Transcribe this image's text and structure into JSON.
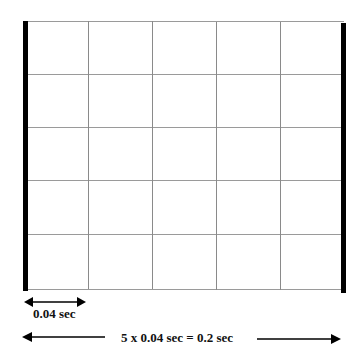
{
  "diagram": {
    "grid": {
      "columns": 5,
      "rows": 5,
      "line_color": "#8a8a8a",
      "boundary_color": "#000000"
    },
    "small_interval_label": "0.04 sec",
    "total_interval_label": "5 x 0.04 sec = 0.2 sec"
  }
}
